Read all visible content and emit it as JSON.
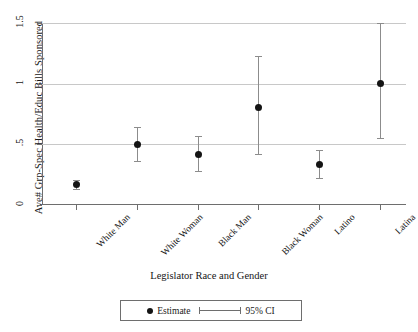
{
  "chart_data": {
    "type": "scatter",
    "title": "",
    "xlabel": "Legislator Race and Gender",
    "ylabel": "Ave# Grp-Spec Health/Educ Bills Sponsored",
    "categories": [
      "White Man",
      "White Woman",
      "Black Man",
      "Black Woman",
      "Latino",
      "Latina"
    ],
    "values": [
      0.17,
      0.5,
      0.42,
      0.8,
      0.33,
      1.0
    ],
    "ci_low": [
      0.13,
      0.36,
      0.28,
      0.42,
      0.22,
      0.55
    ],
    "ci_high": [
      0.21,
      0.64,
      0.57,
      1.23,
      0.45,
      1.5
    ],
    "ylim": [
      0,
      1.5
    ],
    "yticks": [
      0,
      0.5,
      1,
      1.5
    ],
    "ytick_labels": [
      "0",
      ".5",
      "1",
      "1.5"
    ],
    "grid": true,
    "legend_position": "bottom",
    "series": [
      {
        "name": "Estimate",
        "marker": "filled-circle"
      },
      {
        "name": "95% CI",
        "marker": "capped-line"
      }
    ]
  },
  "legend": {
    "estimate_label": "Estimate",
    "ci_label": "95% CI"
  },
  "colors": {
    "marker": "#141414",
    "ci": "#8c8c8c",
    "grid": "#c8c8c8",
    "axis": "#6e6e6e",
    "background": "#ffffff"
  }
}
